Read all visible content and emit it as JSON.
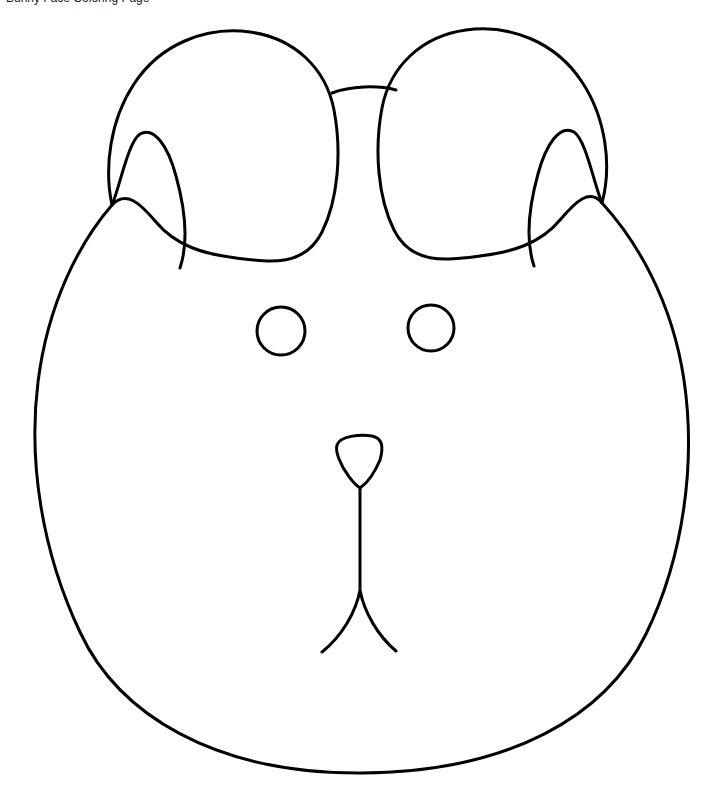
{
  "page": {
    "title": "Bunny Face Coloring Page",
    "background_color": "#ffffff",
    "width": 720,
    "height": 809
  },
  "caption": {
    "text": "Bunny Face Coloring Page",
    "note": "clipped at top edge of scan"
  },
  "artwork": {
    "kind": "line-drawing",
    "subject": "bunny-face",
    "style": "black-outline-coloring-page",
    "stroke_color": "#000000",
    "fill_color": "#ffffff",
    "stroke_width": 3,
    "parts": [
      {
        "name": "head",
        "label": "Head"
      },
      {
        "name": "left-ear",
        "label": "Left ear"
      },
      {
        "name": "right-ear",
        "label": "Right ear"
      },
      {
        "name": "left-ear-fold",
        "label": "Left ear inner fold"
      },
      {
        "name": "right-ear-fold",
        "label": "Right ear inner fold"
      },
      {
        "name": "forehead-bridge",
        "label": "Forehead bridge line"
      },
      {
        "name": "left-eye",
        "label": "Left eye"
      },
      {
        "name": "right-eye",
        "label": "Right eye"
      },
      {
        "name": "nose",
        "label": "Nose"
      },
      {
        "name": "mouth",
        "label": "Mouth"
      }
    ],
    "geometry": {
      "head_path": "M 602 203 C 636 240 672 300 684 380 C 696 462 684 556 646 634 C 606 716 510 772 362 773 C 214 774 118 714 80 632 C 42 552 28 462 38 382 C 48 302 80 242 112 205",
      "left_ear_path": "M 112 205 C 104 168 110 120 134 84 C 160 44 206 26 250 32 C 294 38 326 68 334 110 C 342 152 338 200 322 232 C 304 268 268 262 236 258 C 204 254 176 246 156 222 C 140 203 126 190 112 205 Z",
      "right_ear_path": "M 602 203 C 612 166 606 118 582 82 C 556 42 510 24 466 30 C 422 36 390 66 382 108 C 374 150 378 198 394 230 C 412 266 448 260 480 256 C 512 252 540 244 560 220 C 576 201 590 188 602 203 Z",
      "left_ear_fold_path": "M 112 205 C 120 186 128 142 140 134 C 154 126 168 146 176 176 C 186 212 188 244 180 268",
      "right_ear_fold_path": "M 602 203 C 594 184 586 140 574 132 C 560 124 546 144 538 174 C 528 210 526 242 534 266",
      "forehead_bridge_path": "M 332 93 C 350 86 378 85 396 90",
      "left_eye": {
        "cx": 281,
        "cy": 331,
        "r": 24
      },
      "right_eye": {
        "cx": 431,
        "cy": 328,
        "r": 23
      },
      "nose_path": "M 337 445 C 340 436 360 434 372 436 C 382 438 384 446 380 460 C 374 474 366 484 360 488 C 354 484 344 472 339 459 C 336 451 336 448 337 445 Z",
      "mouth_path": "M 360 488 L 360 590 M 360 590 C 356 612 342 636 322 652 M 360 590 C 364 612 378 636 396 651"
    }
  }
}
